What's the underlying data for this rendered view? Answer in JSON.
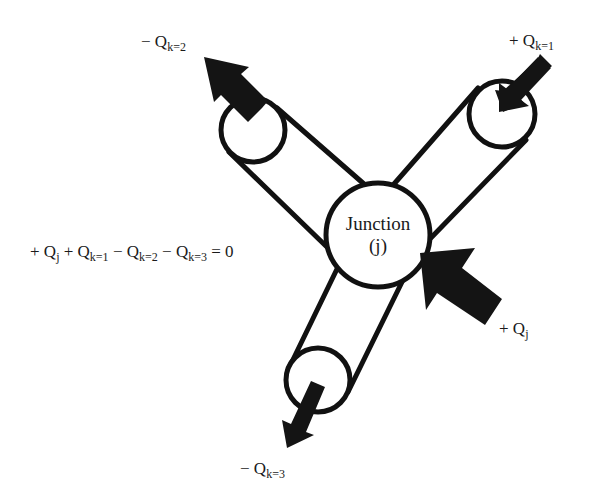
{
  "diagram": {
    "type": "junction_flow_balance",
    "junction": {
      "label_line1": "Junction",
      "label_line2": "(j)"
    },
    "flows": [
      {
        "id": "k1",
        "sign": "+",
        "symbol": "Q",
        "subscript": "k=1",
        "direction": "into junction"
      },
      {
        "id": "k2",
        "sign": "−",
        "symbol": "Q",
        "subscript": "k=2",
        "direction": "out of junction"
      },
      {
        "id": "k3",
        "sign": "−",
        "symbol": "Q",
        "subscript": "k=3",
        "direction": "out of junction"
      },
      {
        "id": "j",
        "sign": "+",
        "symbol": "Q",
        "subscript": "j",
        "direction": "external inflow into junction"
      }
    ],
    "equation": {
      "terms": [
        {
          "sign": "+",
          "symbol": "Q",
          "subscript": "j"
        },
        {
          "sign": "+",
          "symbol": "Q",
          "subscript": "k=1"
        },
        {
          "sign": "−",
          "symbol": "Q",
          "subscript": "k=2"
        },
        {
          "sign": "−",
          "symbol": "Q",
          "subscript": "k=3"
        }
      ],
      "equals": "= 0"
    },
    "colors": {
      "stroke": "#111111",
      "arrow_fill": "#141414",
      "background": "#ffffff"
    }
  }
}
